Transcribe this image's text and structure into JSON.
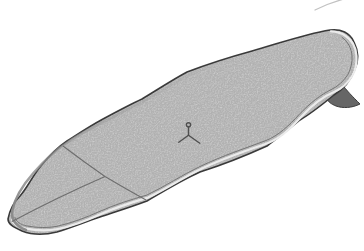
{
  "figure": {
    "alt": "Grayscale technical line drawing of a stand-up paddleboard seen from above at an angle; the rounded nose points to the lower left and the squared tail to the upper right. Two thin seam lines cross the nose deck (a diagonal cross seam and a center stringer), a small three-pronged logo with a tiny circle sits mid-deck, and a single dark swept-back fin projects from the tail edge.",
    "orientation": "nose lower-left, tail upper-right",
    "style": "patent-style shaded line art on white background",
    "colors": {
      "background": "#ffffff",
      "deck": "#d3d3d3",
      "outline": "#3e3e3e",
      "rail_highlight": "#ebebeb",
      "rail_inner": "#757575",
      "nose_shading": "#8a8a8a",
      "seams": "#6e6e6e",
      "logo": "#4f4f4f",
      "fin_fill": "#666666",
      "fin_outline": "#3c3c3c",
      "stray_curve": "#c2c2c2"
    },
    "parts": {
      "deck": "deck surface",
      "cross_seam": "diagonal nose cross seam from top rail to bottom rail",
      "stringer": "center stringer seam from seam junction to nose tip",
      "logo": "three-pronged logo with small circle on upper arm",
      "fin": "single swept-back tail fin",
      "rail": "rail edge with light highlight band and inner deck line"
    }
  }
}
